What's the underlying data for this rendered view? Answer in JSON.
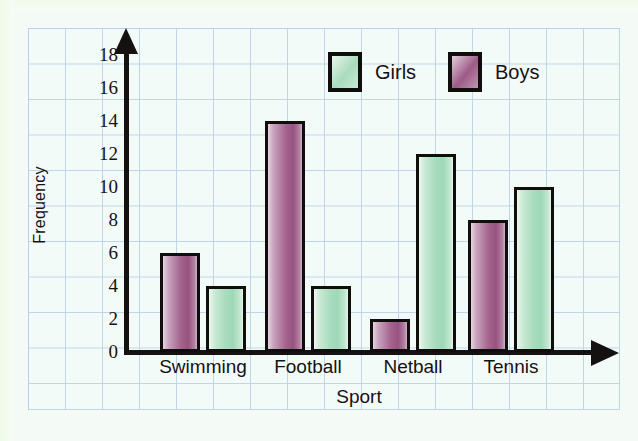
{
  "chart_data": {
    "type": "bar",
    "title": "",
    "xlabel": "Sport",
    "ylabel": "Frequency",
    "categories": [
      "Swimming",
      "Football",
      "Netball",
      "Tennis"
    ],
    "series": [
      {
        "name": "Boys",
        "color": "#9d5b87",
        "values": [
          6,
          14,
          2,
          8
        ]
      },
      {
        "name": "Girls",
        "color": "#a9dcbe",
        "values": [
          4,
          4,
          12,
          10
        ]
      }
    ],
    "series_order_in_group": [
      "Boys",
      "Girls"
    ],
    "ylim": [
      0,
      18
    ],
    "yticks": [
      0,
      2,
      4,
      6,
      8,
      10,
      12,
      14,
      16,
      18
    ],
    "ytick_labels": [
      "0",
      "2",
      "4",
      "6",
      "8",
      "10",
      "12",
      "14",
      "16",
      "18"
    ],
    "grid": true,
    "grid_style": "graph-paper squares, light blue",
    "legend_position": "top-center",
    "axis_arrows": true
  },
  "legend": {
    "items": [
      {
        "label": "Girls",
        "swatch": "girls"
      },
      {
        "label": "Boys",
        "swatch": "boys"
      }
    ]
  },
  "axes": {
    "y_title": "Frequency",
    "x_title": "Sport"
  },
  "colors": {
    "page_background": "#f4fbf6",
    "grid_line": "#b9cfe8",
    "grid_fill": "#f3fbfa",
    "axis": "#141110",
    "boys_bar": "#9d5b87",
    "girls_bar": "#a9dcbe",
    "bar_outline": "#100d0d",
    "text": "#151212"
  }
}
